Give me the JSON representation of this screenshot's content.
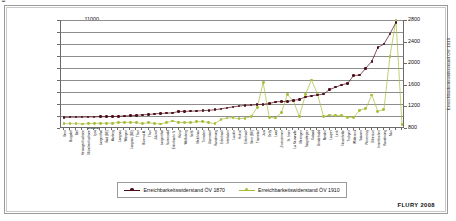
{
  "credit": "FLURY 2008",
  "legend": {
    "items": [
      {
        "label": "Erreichbarkeitswiderstand ÖV 1870",
        "color": "#4d0d18"
      },
      {
        "label": "Erreichbarkeitswiderstand ÖV 1910",
        "color": "#a8bd3a"
      }
    ]
  },
  "chart_data": {
    "type": "line",
    "title": "",
    "xlabel": "",
    "ylabel": "Erreichbarkeitswiderstand ÖV 1870",
    "y2label": "Erreichbarkeitswiderstand ÖV 1910",
    "ylim": [
      2000,
      11000
    ],
    "y2lim": [
      800,
      2800
    ],
    "yticks": [
      2000,
      3000,
      4000,
      5000,
      6000,
      7000,
      8000,
      9000,
      10000,
      11000
    ],
    "y2ticks": [
      800,
      1200,
      1600,
      2000,
      2400,
      2800
    ],
    "grid": true,
    "legend_position": "bottom",
    "categories": [
      "Bern",
      "Burgdorf",
      "Biel",
      "Herzogenbuchsee",
      "Münchenbuchsee",
      "Lyss",
      "Langenthal",
      "Bad (BE)",
      "Aarberg",
      "Langnau",
      "Wangen",
      "Langnau (BE)",
      "Thun",
      "Büren a.A.",
      "Thun",
      "Zäziwil",
      "Langenthal",
      "Sumiswald",
      "Erlenbach i.S.",
      "Köniz",
      "Wolfisberg",
      "Sefik",
      "Melchnau",
      "Trimstein",
      "Utzenstorf",
      "Kandersteg",
      "Erlenbach",
      "Interlaken",
      "Laufen",
      "Huttwil",
      "Erlenbach",
      "Bern (BE)",
      "Tramelan",
      "Jura",
      "Delly",
      "Laax",
      "Zweisimmen",
      "St. Imier",
      "La Neuveville",
      "Meiringen",
      "Saignelégier",
      "Gstaad",
      "Grindelwald",
      "Meiden",
      "Lauper",
      "Lenk",
      "Neuenfelde",
      "Trubgen",
      "Wilderswil",
      "Saanen",
      "Porrentruy",
      "Biberzurt",
      "Innertkirchen",
      "Kandersteg",
      "Muri"
    ],
    "series": [
      {
        "name": "Erreichbarkeitswiderstand ÖV 1870",
        "color": "#4d0d18",
        "axis": "left",
        "values": [
          2880,
          2900,
          2900,
          2910,
          2920,
          2930,
          2940,
          2950,
          2960,
          2980,
          3000,
          3020,
          3060,
          3100,
          3120,
          3180,
          3210,
          3240,
          3260,
          3380,
          3390,
          3400,
          3420,
          3440,
          3480,
          3520,
          3600,
          3680,
          3760,
          3830,
          3880,
          3900,
          3950,
          3980,
          4030,
          4180,
          4200,
          4220,
          4300,
          4380,
          4600,
          4680,
          4760,
          4820,
          5200,
          5400,
          5600,
          5720,
          6380,
          6400,
          6980,
          7560,
          8700,
          9000,
          9850
        ]
      },
      {
        "name": "Erreichbarkeitswiderstand ÖV 1910",
        "color": "#a8bd3a",
        "axis": "right",
        "values": [
          880,
          880,
          880,
          875,
          880,
          885,
          885,
          890,
          890,
          900,
          905,
          905,
          900,
          880,
          900,
          880,
          875,
          900,
          930,
          905,
          900,
          900,
          915,
          920,
          900,
          880,
          960,
          985,
          990,
          970,
          980,
          1010,
          1180,
          1640,
          1000,
          985,
          1080,
          1420,
          1300,
          1010,
          1420,
          1690,
          1430,
          1015,
          1040,
          1030,
          1025,
          1000,
          1000,
          1130,
          1160,
          1410,
          1110,
          1140,
          2120
        ]
      }
    ],
    "extra_tail": {
      "series_1870": [
        10790
      ],
      "series_1910": [
        2800,
        870
      ]
    }
  }
}
